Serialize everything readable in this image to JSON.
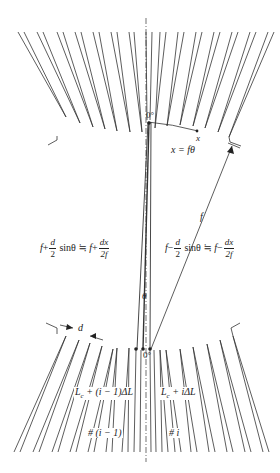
{
  "diagram": {
    "type": "arrayed-waveguide-grating-star-coupler-geometry",
    "colors": {
      "line": "#333333",
      "background": "#ffffff",
      "text": "#222222"
    },
    "labels": {
      "top_focus": "0°",
      "bottom_focus": "0°",
      "arc_point": "x",
      "arc_relation": "x = fθ",
      "focal_length": "f",
      "angle": "θ",
      "pitch": "d",
      "left_path": {
        "lhs_f": "f",
        "plus1": "+",
        "d_num": "d",
        "d_den": "2",
        "sin": "sinθ",
        "approx": "≒",
        "rhs_f": "f",
        "plus2": "+",
        "dx_num": "dx",
        "dx_den": "2f"
      },
      "right_path": {
        "lhs_f": "f",
        "minus1": "−",
        "d_num": "d",
        "d_den": "2",
        "sin": "sinθ",
        "approx": "≒",
        "rhs_f": "f",
        "minus2": "−",
        "dx_num": "dx",
        "dx_den": "2f"
      },
      "left_length": "L",
      "left_length_sub": "c",
      "left_length_rest": " + (i − 1)ΔL",
      "right_length": "L",
      "right_length_sub": "c",
      "right_length_rest": " + iΔL",
      "left_index": "# (i − 1)",
      "right_index": "# i"
    }
  }
}
